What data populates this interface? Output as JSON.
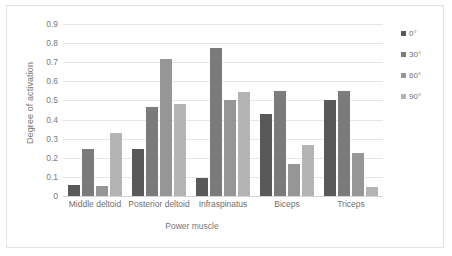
{
  "chart_data": {
    "type": "bar",
    "title": "",
    "xlabel": "Power muscle",
    "ylabel": "Degree of activation",
    "categories": [
      "Middle deltoid",
      "Posterior deltoid",
      "Infraspinatus",
      "Biceps",
      "Triceps"
    ],
    "series": [
      {
        "name": "0°",
        "color": "#595959",
        "values": [
          0.06,
          0.245,
          0.095,
          0.43,
          0.5
        ]
      },
      {
        "name": "30°",
        "color": "#7b7b7b",
        "values": [
          0.245,
          0.465,
          0.775,
          0.55,
          0.55
        ]
      },
      {
        "name": "60°",
        "color": "#969696",
        "values": [
          0.055,
          0.715,
          0.505,
          0.17,
          0.225
        ]
      },
      {
        "name": "90°",
        "color": "#b4b4b4",
        "values": [
          0.33,
          0.48,
          0.545,
          0.265,
          0.045
        ]
      }
    ],
    "ylim": [
      0,
      0.9
    ],
    "ytick_labels": [
      "0.9",
      "0.8",
      "0.7",
      "0.6",
      "0.5",
      "0.4",
      "0.3",
      "0.2",
      "0.1",
      "0"
    ],
    "ytick_values": [
      0.9,
      0.8,
      0.7,
      0.6,
      0.5,
      0.4,
      0.3,
      0.2,
      0.1,
      0
    ],
    "grid": true,
    "legend_position": "right",
    "grid_color": "#e6e6e6",
    "border_color": "#e2e2e2",
    "text_color": "#6f6f6f"
  }
}
